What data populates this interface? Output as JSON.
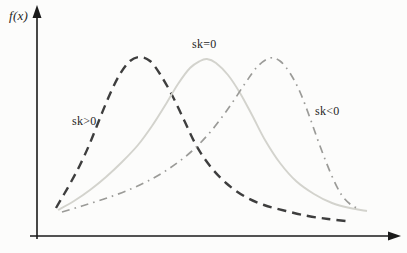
{
  "figure": {
    "background": "#fcfcfb"
  },
  "axis": {
    "y_label": "f(x)",
    "color": "#1a1a1a"
  },
  "annotations": {
    "sk_positive": "sk>0",
    "sk_zero": "sk=0",
    "sk_negative": "sk<0"
  },
  "chart_data": {
    "type": "line",
    "title": "",
    "xlabel": "",
    "ylabel": "f(x)",
    "coordinate_space": "pixel",
    "grid": false,
    "legend_position": "inline-annotations",
    "series": [
      {
        "id": "sk-positive",
        "name": "sk>0",
        "style": "dashed",
        "color": "#3e3e3e",
        "points": [
          [
            56,
            208
          ],
          [
            63,
            196
          ],
          [
            71,
            182
          ],
          [
            80,
            165
          ],
          [
            90,
            143
          ],
          [
            100,
            118
          ],
          [
            110,
            94
          ],
          [
            120,
            74
          ],
          [
            130,
            61
          ],
          [
            140,
            57
          ],
          [
            150,
            61
          ],
          [
            160,
            74
          ],
          [
            172,
            95
          ],
          [
            184,
            120
          ],
          [
            196,
            145
          ],
          [
            210,
            166
          ],
          [
            226,
            183
          ],
          [
            244,
            196
          ],
          [
            264,
            205
          ],
          [
            286,
            211
          ],
          [
            308,
            216
          ],
          [
            328,
            219
          ],
          [
            346,
            221
          ]
        ]
      },
      {
        "id": "sk-zero",
        "name": "sk=0",
        "style": "solid",
        "color": "#d3d3cd",
        "points": [
          [
            58,
            210
          ],
          [
            74,
            201
          ],
          [
            90,
            190
          ],
          [
            106,
            177
          ],
          [
            122,
            162
          ],
          [
            138,
            145
          ],
          [
            152,
            126
          ],
          [
            166,
            104
          ],
          [
            178,
            84
          ],
          [
            190,
            68
          ],
          [
            200,
            61
          ],
          [
            207,
            59
          ],
          [
            216,
            63
          ],
          [
            228,
            75
          ],
          [
            240,
            93
          ],
          [
            252,
            115
          ],
          [
            265,
            140
          ],
          [
            280,
            163
          ],
          [
            296,
            181
          ],
          [
            314,
            194
          ],
          [
            332,
            203
          ],
          [
            350,
            208
          ],
          [
            367,
            211
          ]
        ]
      },
      {
        "id": "sk-negative",
        "name": "sk<0",
        "style": "dashdot",
        "color": "#9b9b98",
        "points": [
          [
            62,
            212
          ],
          [
            82,
            206
          ],
          [
            104,
            199
          ],
          [
            126,
            191
          ],
          [
            148,
            181
          ],
          [
            170,
            168
          ],
          [
            192,
            151
          ],
          [
            212,
            130
          ],
          [
            230,
            106
          ],
          [
            246,
            82
          ],
          [
            258,
            66
          ],
          [
            270,
            58
          ],
          [
            280,
            61
          ],
          [
            290,
            73
          ],
          [
            300,
            92
          ],
          [
            310,
            118
          ],
          [
            320,
            146
          ],
          [
            331,
            174
          ],
          [
            341,
            194
          ],
          [
            350,
            204
          ],
          [
            359,
            209
          ]
        ]
      }
    ],
    "layout": {
      "y_axis": {
        "x": 37,
        "y_top": 5,
        "y_bottom": 239
      },
      "x_axis": {
        "y": 236,
        "x_left": 30,
        "x_right": 401
      },
      "arrow_length": 13,
      "arrow_half_width": 4.5
    }
  }
}
